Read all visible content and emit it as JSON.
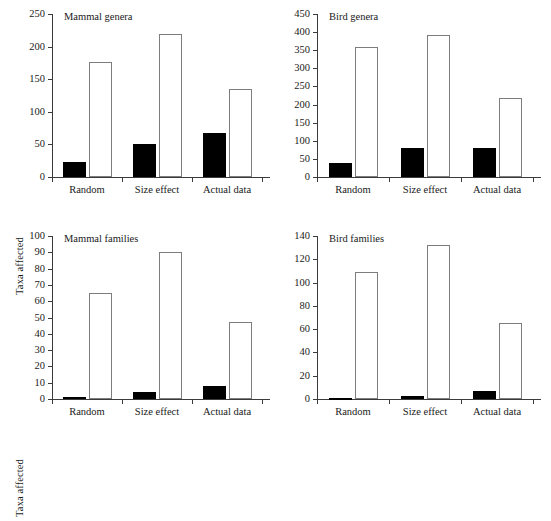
{
  "figure": {
    "layout": "2x2 grid of bar charts",
    "background": "#ffffff",
    "bar_fill_color": "#000000",
    "bar_open_color": "#ffffff",
    "bar_outline_color": "#7d7d7d",
    "axis_color": "#3b3b3b"
  },
  "chart_data": [
    {
      "type": "bar",
      "title": "Mammal genera",
      "panel": "top-left",
      "xlabel": "",
      "ylabel": "Taxa affected",
      "categories": [
        "Random",
        "Size effect",
        "Actual data"
      ],
      "ylim": [
        0,
        250
      ],
      "yticks": [
        0,
        50,
        100,
        150,
        200,
        250
      ],
      "grid": false,
      "legend": "none",
      "series": [
        {
          "name": "filled",
          "values": [
            23,
            50,
            68
          ]
        },
        {
          "name": "open",
          "values": [
            177,
            220,
            135
          ]
        }
      ]
    },
    {
      "type": "bar",
      "title": "Bird genera",
      "panel": "top-right",
      "xlabel": "",
      "ylabel": "",
      "categories": [
        "Random",
        "Size effect",
        "Actual data"
      ],
      "ylim": [
        0,
        450
      ],
      "yticks": [
        0,
        50,
        100,
        150,
        200,
        250,
        300,
        350,
        400,
        450
      ],
      "grid": false,
      "legend": "none",
      "series": [
        {
          "name": "filled",
          "values": [
            40,
            81,
            80
          ]
        },
        {
          "name": "open",
          "values": [
            360,
            393,
            217
          ]
        }
      ]
    },
    {
      "type": "bar",
      "title": "Mammal families",
      "panel": "bottom-left",
      "xlabel": "",
      "ylabel": "Taxa affected",
      "categories": [
        "Random",
        "Size effect",
        "Actual data"
      ],
      "ylim": [
        0,
        100
      ],
      "yticks": [
        0,
        10,
        20,
        30,
        40,
        50,
        60,
        70,
        80,
        90,
        100
      ],
      "grid": false,
      "legend": "none",
      "series": [
        {
          "name": "filled",
          "values": [
            1,
            4,
            8
          ]
        },
        {
          "name": "open",
          "values": [
            65,
            90,
            47
          ]
        }
      ]
    },
    {
      "type": "bar",
      "title": "Bird families",
      "panel": "bottom-right",
      "xlabel": "",
      "ylabel": "",
      "categories": [
        "Random",
        "Size effect",
        "Actual data"
      ],
      "ylim": [
        0,
        140
      ],
      "yticks": [
        0,
        20,
        40,
        60,
        80,
        100,
        120,
        140
      ],
      "grid": false,
      "legend": "none",
      "series": [
        {
          "name": "filled",
          "values": [
            1,
            3,
            7
          ]
        },
        {
          "name": "open",
          "values": [
            109,
            132,
            65
          ]
        }
      ]
    }
  ]
}
